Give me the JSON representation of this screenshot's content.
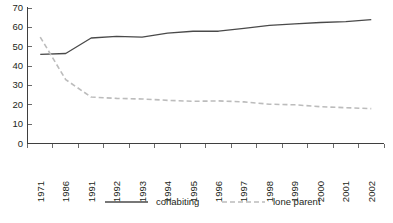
{
  "chart_data": {
    "type": "line",
    "title": "",
    "subtitle": "",
    "xlabel": "",
    "ylabel": "",
    "ylim": [
      0,
      70
    ],
    "ytick_step": 10,
    "yticks": [
      70,
      60,
      50,
      40,
      30,
      20,
      10,
      0
    ],
    "grid": false,
    "legend_position": "bottom",
    "categories": [
      "1971",
      "1986",
      "1991",
      "1992",
      "1993",
      "1994",
      "1995",
      "1996",
      "1997",
      "1998",
      "1999",
      "2000",
      "2001",
      "2002"
    ],
    "series": [
      {
        "name": "cohabiting",
        "style": "solid",
        "color": "#4a4a4a",
        "values": [
          46,
          46.5,
          54.5,
          55.3,
          55,
          57,
          58,
          58,
          59.5,
          61,
          61.8,
          62.5,
          63,
          64
        ]
      },
      {
        "name": "lone parent",
        "style": "dashed",
        "color": "#bcbcbc",
        "values": [
          55,
          33,
          24,
          23.3,
          23,
          22.3,
          21.8,
          22,
          21.5,
          20.3,
          20,
          19,
          18.5,
          18
        ]
      }
    ]
  },
  "legend": {
    "items": [
      {
        "label": "cohabiting",
        "style": "solid",
        "color": "#4a4a4a"
      },
      {
        "label": "lone parent",
        "style": "dashed",
        "color": "#bcbcbc"
      }
    ]
  },
  "axes": {
    "y_labels": [
      "70",
      "60",
      "50",
      "40",
      "30",
      "20",
      "10",
      "0"
    ],
    "x_labels": [
      "1971",
      "1986",
      "1991",
      "1992",
      "1993",
      "1994",
      "1995",
      "1996",
      "1997",
      "1998",
      "1999",
      "2000",
      "2001",
      "2002"
    ]
  }
}
